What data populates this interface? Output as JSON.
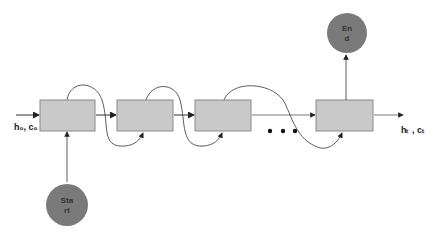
{
  "diagram": {
    "type": "LSTM chain",
    "input_label": "h₀, c₀",
    "output_label": "hₜ , cₜ",
    "ellipsis": "•  •  •",
    "start_node": {
      "line1": "Sta",
      "line2": "rt"
    },
    "end_node": {
      "line1": "En",
      "line2": "d"
    },
    "cells": [
      {
        "id": "cell-1"
      },
      {
        "id": "cell-2"
      },
      {
        "id": "cell-3"
      },
      {
        "id": "cell-t"
      }
    ],
    "colors": {
      "cell_fill": "#c9c9c9",
      "cell_border": "#8a8a8a",
      "circle_fill": "#7a7a7a",
      "line": "#333333"
    }
  }
}
